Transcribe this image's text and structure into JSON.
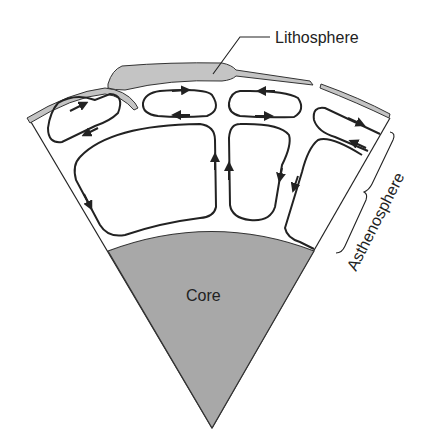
{
  "diagram": {
    "type": "earth-cross-section-mantle-convection",
    "labels": {
      "lithosphere": "Lithosphere",
      "asthenosphere": "Asthenosphere",
      "core": "Core"
    },
    "colors": {
      "core_fill": "#a8a8a8",
      "lithosphere_fill": "#c4c4c4",
      "stroke": "#222222",
      "background": "#ffffff"
    },
    "convection_cells": [
      {
        "id": "top-left",
        "direction": "clockwise"
      },
      {
        "id": "top-center-left",
        "direction": "clockwise"
      },
      {
        "id": "top-center-right",
        "direction": "counterclockwise"
      },
      {
        "id": "top-right",
        "direction": "counterclockwise"
      },
      {
        "id": "bottom-left",
        "direction": "clockwise"
      },
      {
        "id": "bottom-center",
        "direction": "counterclockwise"
      },
      {
        "id": "bottom-right",
        "direction": "counterclockwise"
      }
    ]
  }
}
